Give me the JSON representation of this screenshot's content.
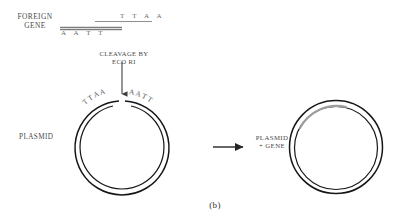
{
  "figure": {
    "caption": "(b)",
    "title_implied": "Formation of recombinant plasmid by EcoRI cleavage"
  },
  "labels": {
    "foreign_gene_line1": "FOREIGN",
    "foreign_gene_line2": "GENE",
    "cleavage_line1": "CLEAVAGE BY",
    "cleavage_line2": "ECO RI",
    "plasmid": "PLASMID",
    "plasmid_gene_line1": "PLASMID",
    "plasmid_gene_line2": "+ GENE"
  },
  "foreign_gene": {
    "top_strand_bases": "T T A A",
    "bottom_strand_bases": "A A T T"
  },
  "plasmid_left": {
    "sticky_end_left_bases": [
      "T",
      "T",
      "A",
      "A"
    ],
    "sticky_end_right_bases": [
      "A",
      "A",
      "T",
      "T"
    ]
  },
  "colors": {
    "stroke": "#1a1a1a",
    "gene_insert": "#9a9a9a",
    "strand": "#8a8a8a",
    "text": "#4a4a4a",
    "background": "#ffffff"
  }
}
